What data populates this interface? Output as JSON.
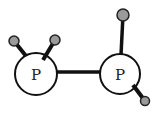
{
  "diagram": {
    "colors": {
      "bond": "#111111",
      "p_atom_fill": "#ffffff",
      "p_atom_stroke": "#111111",
      "h_atom_fill": "#9a9a9a",
      "h_atom_stroke": "#222222",
      "label": "#222222"
    },
    "atoms": [
      {
        "id": "P1",
        "element": "P",
        "label": "P",
        "cx": 36,
        "cy": 74,
        "r": 21
      },
      {
        "id": "P2",
        "element": "P",
        "label": "P",
        "cx": 120,
        "cy": 74,
        "r": 20
      },
      {
        "id": "H1",
        "element": "H",
        "label": "",
        "cx": 14,
        "cy": 41,
        "r": 5
      },
      {
        "id": "H2",
        "element": "H",
        "label": "",
        "cx": 55,
        "cy": 40,
        "r": 5
      },
      {
        "id": "H3",
        "element": "H",
        "label": "",
        "cx": 123,
        "cy": 15,
        "r": 6
      },
      {
        "id": "H4",
        "element": "H",
        "label": "",
        "cx": 145,
        "cy": 101,
        "r": 4.5
      }
    ],
    "bonds": [
      {
        "from": "P1",
        "to": "P2"
      },
      {
        "from": "P1",
        "to": "H1"
      },
      {
        "from": "P1",
        "to": "H2"
      },
      {
        "from": "P2",
        "to": "H3"
      },
      {
        "from": "P2",
        "to": "H4"
      }
    ]
  }
}
